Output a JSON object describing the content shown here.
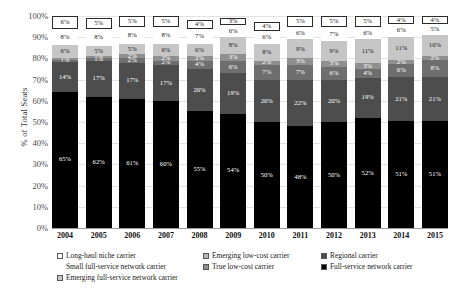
{
  "chart_data": {
    "type": "bar",
    "title": "",
    "xlabel": "",
    "ylabel": "% of Total Seats",
    "ylim": [
      0,
      100
    ],
    "grid": true,
    "stacked": true,
    "legend_position": "bottom",
    "categories": [
      "2004",
      "2005",
      "2006",
      "2007",
      "2008",
      "2009",
      "2010",
      "2011",
      "2012",
      "2013",
      "2014",
      "2015"
    ],
    "ytick_labels": [
      "100%",
      "90%",
      "80%",
      "70%",
      "60%",
      "50%",
      "40%",
      "30%",
      "20%",
      "10%",
      "0%"
    ],
    "ytick_values": [
      100,
      90,
      80,
      70,
      60,
      50,
      40,
      30,
      20,
      10,
      0
    ],
    "series": [
      {
        "name": "Full-service network carrier",
        "color": "#000000",
        "text_color": "#ffffff",
        "values": [
          65,
          62,
          61,
          60,
          55,
          54,
          50,
          48,
          50,
          52,
          51,
          51
        ],
        "labels": [
          "65%",
          "62%",
          "61%",
          "60%",
          "55%",
          "54%",
          "50%",
          "48%",
          "50%",
          "52%",
          "51%",
          "51%"
        ]
      },
      {
        "name": "Emerging full-service network carrier",
        "color": "#4d4d4d",
        "text_color": "#ffffff",
        "values": [
          14,
          17,
          17,
          17,
          20,
          19,
          20,
          22,
          20,
          19,
          21,
          21
        ],
        "labels": [
          "14%",
          "17%",
          "17%",
          "17%",
          "20%",
          "19%",
          "20%",
          "22%",
          "20%",
          "19%",
          "21%",
          "21%"
        ]
      },
      {
        "name": "True low-cost carrier",
        "color": "#6e6e6e",
        "text_color": "#ffffff",
        "values": [
          1,
          1,
          2,
          2,
          4,
          6,
          7,
          7,
          6,
          4,
          6,
          8
        ],
        "labels": [
          "1%",
          "1%",
          "2%",
          "2%",
          "4%",
          "6%",
          "7%",
          "7%",
          "6%",
          "4%",
          "6%",
          "8%"
        ]
      },
      {
        "name": "Long-haul niche carrier",
        "color": "#8f8f8f",
        "text_color": "#ffffff",
        "values": [
          1,
          1,
          2,
          2,
          2,
          3,
          2,
          3,
          3,
          3,
          2,
          2
        ],
        "labels": [
          "1%",
          "1%",
          "2%",
          "2%",
          "2%",
          "3%",
          "2%",
          "3%",
          "3%",
          "3%",
          "2%",
          "2%"
        ]
      },
      {
        "name": "Small full-service network carrier",
        "color": "#c6c6c6",
        "text_color": "#1a1a1a",
        "values": [
          6,
          5,
          5,
          6,
          6,
          8,
          8,
          9,
          9,
          11,
          11,
          10
        ],
        "labels": [
          "6%",
          "5%",
          "5%",
          "6%",
          "6%",
          "8%",
          "8%",
          "9%",
          "9%",
          "11%",
          "11%",
          "10%"
        ]
      },
      {
        "name": "Emerging low-cost carrier",
        "color": "#ffffff",
        "text_color": "#1a1a1a",
        "values": [
          8,
          8,
          8,
          8,
          7,
          6,
          6,
          6,
          7,
          6,
          6,
          5
        ],
        "labels": [
          "8%",
          "8%",
          "8%",
          "8%",
          "7%",
          "6%",
          "6%",
          "6%",
          "7%",
          "6%",
          "6%",
          "5%"
        ]
      },
      {
        "name": "Regional carrier",
        "color": "#ffffff",
        "text_color": "#1a1a1a",
        "boxed": true,
        "values": [
          6,
          5,
          5,
          5,
          4,
          3,
          4,
          5,
          5,
          5,
          4,
          4
        ],
        "labels": [
          "6%",
          "5%",
          "5%",
          "5%",
          "4%",
          "3%",
          "4%",
          "5%",
          "5%",
          "5%",
          "4%",
          "4%"
        ]
      }
    ],
    "legend": [
      {
        "label": "Long-haul niche carrier",
        "color": "#ffffff"
      },
      {
        "label": "Emerging low-cost carrier",
        "color": "#b8b8b8"
      },
      {
        "label": "Regional carrier",
        "color": "#4d4d4d"
      },
      {
        "label": "Small full-service network carrier",
        "color": null
      },
      {
        "label": "True low-cost carrier",
        "color": "#8f8f8f"
      },
      {
        "label": "Full-service network carrier",
        "color": "#000000"
      },
      {
        "label": "Emerging full-service network carrier",
        "color": "#c6c6c6"
      }
    ]
  }
}
